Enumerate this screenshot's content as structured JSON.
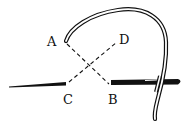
{
  "diagram": {
    "type": "stitch-illustration",
    "points": {
      "A": {
        "label": "A"
      },
      "B": {
        "label": "B"
      },
      "C": {
        "label": "C"
      },
      "D": {
        "label": "D"
      }
    },
    "edges": [
      {
        "from": "A",
        "to": "B",
        "style": "dashed"
      },
      {
        "from": "C",
        "to": "D",
        "style": "dashed"
      }
    ],
    "elements": [
      "thread-left",
      "thread-right",
      "curved-needle"
    ]
  },
  "colors": {
    "ink": "#111111",
    "background": "#ffffff"
  }
}
